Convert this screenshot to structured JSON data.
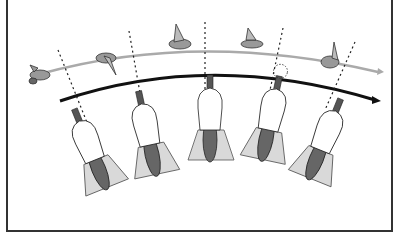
{
  "illustration": {
    "description": "Sequence of five hands holding a shotgun swinging along a curved path, following ducks in flight",
    "colors": {
      "frame": "#333333",
      "flight_path": "#aaaaaa",
      "swing_arc": "#111111",
      "sight_line": "#222222",
      "sleeve": "#d9d9d9",
      "gun": "#555555",
      "stock": "#666666",
      "hand": "#ffffff",
      "duck": "#888888"
    },
    "stages": [
      {
        "name": "stage-1"
      },
      {
        "name": "stage-2"
      },
      {
        "name": "stage-3"
      },
      {
        "name": "stage-4",
        "shot_fired": true
      },
      {
        "name": "stage-5"
      }
    ]
  }
}
